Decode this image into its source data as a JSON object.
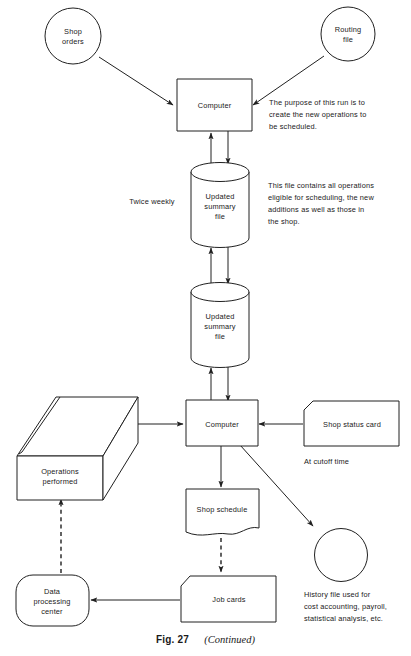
{
  "figure": {
    "caption_number": "Fig. 27",
    "caption_continued": "(Continued)"
  },
  "nodes": {
    "shop_orders": {
      "label_line1": "Shop",
      "label_line2": "orders",
      "shape": "circle"
    },
    "routing_file": {
      "label_line1": "Routing",
      "label_line2": "file",
      "shape": "circle"
    },
    "computer_top": {
      "label": "Computer",
      "shape": "rectangle"
    },
    "updated_summary_file_upper": {
      "label_line1": "Updated",
      "label_line2": "summary",
      "label_line3": "file",
      "shape": "cylinder"
    },
    "updated_summary_file_lower": {
      "label_line1": "Updated",
      "label_line2": "summary",
      "label_line3": "file",
      "shape": "cylinder"
    },
    "computer_bottom": {
      "label": "Computer",
      "shape": "rectangle"
    },
    "shop_status_card": {
      "label": "Shop status card",
      "shape": "punched-card"
    },
    "operations_performed": {
      "label_line1": "Operations",
      "label_line2": "performed",
      "shape": "3d-box"
    },
    "shop_schedule": {
      "label": "Shop schedule",
      "shape": "document"
    },
    "history_file": {
      "label": "",
      "shape": "circle"
    },
    "job_cards": {
      "label": "Job cards",
      "shape": "punched-card"
    },
    "data_processing_center": {
      "label_line1": "Data",
      "label_line2": "processing",
      "label_line3": "center",
      "shape": "stadium"
    }
  },
  "annotations": {
    "top_run_purpose": [
      "The purpose of this run is to",
      "create the new operations to",
      "be scheduled."
    ],
    "summary_file_note": [
      "This file contains all operations",
      "eligible for scheduling, the new",
      "additions as well as those in",
      "the shop."
    ],
    "twice_weekly": "Twice weekly",
    "at_cutoff_time": "At cutoff time",
    "history_file_note": [
      "History file used for",
      "cost accounting, payroll,",
      "statistical analysis, etc."
    ]
  },
  "colors": {
    "ink": "#202020",
    "paper": "#ffffff"
  }
}
